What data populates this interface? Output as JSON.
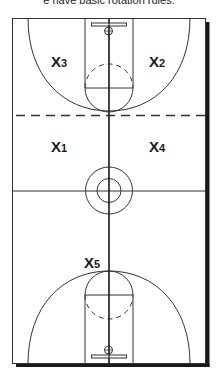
{
  "caption": "e have basic rotation rules.",
  "court": {
    "type": "basketball-full-court",
    "dashed_line": "rotation-boundary"
  },
  "players": [
    {
      "id": "x3",
      "letter": "X",
      "number": "3"
    },
    {
      "id": "x2",
      "letter": "X",
      "number": "2"
    },
    {
      "id": "x1",
      "letter": "X",
      "number": "1"
    },
    {
      "id": "x4",
      "letter": "X",
      "number": "4"
    },
    {
      "id": "x5",
      "letter": "X",
      "number": "5"
    }
  ],
  "colors": {
    "lines": "#333333",
    "shadow": "#1a1a1a",
    "background": "#ffffff"
  }
}
